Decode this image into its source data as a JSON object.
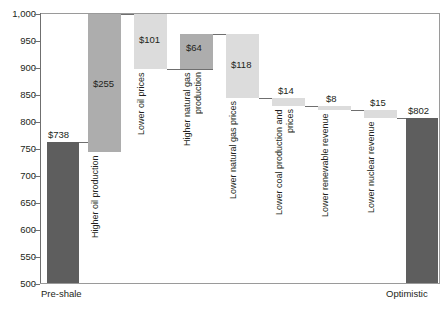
{
  "chart_data": {
    "type": "bar",
    "subtype": "waterfall",
    "title": "",
    "subtitle": "",
    "xlabel": "",
    "ylabel": "",
    "ylim": [
      500,
      1000
    ],
    "ytick_labels": [
      "1,000",
      "950",
      "900",
      "850",
      "800",
      "750",
      "700",
      "650",
      "600",
      "550",
      "500"
    ],
    "ytick_values": [
      1000,
      950,
      900,
      850,
      800,
      750,
      700,
      650,
      600,
      550,
      500
    ],
    "grid": false,
    "legend": "none",
    "categories": [
      "Pre-shale",
      "Higher oil production",
      "Lower oil prices",
      "Higher natural gas production",
      "Lower natural gas prices",
      "Lower coal production and prices",
      "Lower renewable revenue",
      "Lower nuclear revenue",
      "Optimistic"
    ],
    "x_axis_labels": [
      "Pre-shale",
      "Optimistic"
    ],
    "deltas": [
      738,
      255,
      -101,
      64,
      -118,
      -14,
      -8,
      -15,
      802
    ],
    "data_labels": [
      "$738",
      "$255",
      "$101",
      "$64",
      "$118",
      "$14",
      "$8",
      "$15",
      "$802"
    ],
    "cumulative": [
      738,
      993,
      892,
      956,
      838,
      824,
      816,
      801,
      802
    ],
    "bar_kinds": [
      "total",
      "increase",
      "decrease",
      "increase",
      "decrease",
      "decrease",
      "decrease",
      "decrease",
      "total"
    ],
    "colors": {
      "total": "#5e5e5e",
      "increase": "#adadad",
      "decrease": "#dcdcdc",
      "axis": "#6f6f6f",
      "frame": "#9a9a9a",
      "text": "#231f20"
    }
  },
  "bars": [
    {
      "name": "Pre-shale",
      "value_label": "$738",
      "rot_label": "",
      "x_label": "Pre-shale",
      "kind": "total",
      "cls": "dark",
      "left": 47,
      "width": 32,
      "top": 142,
      "height": 141,
      "vlabel_left": 48,
      "vlabel_top": 129,
      "rlabel_left": 0,
      "rlabel_top": 0,
      "rlabel_height": 0,
      "connector_left": 0,
      "connector_top": 0,
      "connector_width": 0
    },
    {
      "name": "Higher oil production",
      "value_label": "$255",
      "rot_label": "Higher oil production",
      "x_label": "",
      "kind": "increase",
      "cls": "mid",
      "left": 88,
      "width": 33,
      "top": 14,
      "height": 138,
      "vlabel_left": 93,
      "vlabel_top": 78,
      "rlabel_left": 90,
      "rlabel_top": 155,
      "rlabel_height": 100,
      "connector_left": 79,
      "connector_top": 142,
      "connector_width": 42
    },
    {
      "name": "Lower oil prices",
      "value_label": "$101",
      "rot_label": "Lower oil prices",
      "x_label": "",
      "kind": "decrease",
      "cls": "light",
      "left": 134,
      "width": 33,
      "top": 14,
      "height": 55,
      "vlabel_left": 139,
      "vlabel_top": 34,
      "rlabel_left": 136,
      "rlabel_top": 72,
      "rlabel_height": 90,
      "connector_left": 121,
      "connector_top": 14,
      "connector_width": 46
    },
    {
      "name": "Higher natural gas production",
      "value_label": "$64",
      "rot_label": "Higher natural gas production",
      "x_label": "",
      "kind": "increase",
      "cls": "mid",
      "left": 180,
      "width": 33,
      "top": 34,
      "height": 35,
      "vlabel_left": 186,
      "vlabel_top": 42,
      "rlabel_left": 182,
      "rlabel_top": 72,
      "rlabel_height": 110,
      "connector_left": 167,
      "connector_top": 69,
      "connector_width": 46
    },
    {
      "name": "Lower natural gas prices",
      "value_label": "$118",
      "rot_label": "Lower natural gas prices",
      "x_label": "",
      "kind": "decrease",
      "cls": "light",
      "left": 226,
      "width": 33,
      "top": 34,
      "height": 64,
      "vlabel_left": 231,
      "vlabel_top": 59,
      "rlabel_left": 228,
      "rlabel_top": 101,
      "rlabel_height": 110,
      "connector_left": 213,
      "connector_top": 34,
      "connector_width": 46
    },
    {
      "name": "Lower coal production and prices",
      "value_label": "$14",
      "rot_label": "Lower coal production and prices",
      "x_label": "",
      "kind": "decrease",
      "cls": "light",
      "left": 272,
      "width": 33,
      "top": 98,
      "height": 8,
      "vlabel_left": 278,
      "vlabel_top": 85,
      "rlabel_left": 274,
      "rlabel_top": 109,
      "rlabel_height": 120,
      "connector_left": 259,
      "connector_top": 98,
      "connector_width": 46
    },
    {
      "name": "Lower renewable revenue",
      "value_label": "$8",
      "rot_label": "Lower renewable revenue",
      "x_label": "",
      "kind": "decrease",
      "cls": "light",
      "left": 318,
      "width": 33,
      "top": 106,
      "height": 4,
      "vlabel_left": 326,
      "vlabel_top": 93,
      "rlabel_left": 320,
      "rlabel_top": 113,
      "rlabel_height": 110,
      "connector_left": 305,
      "connector_top": 106,
      "connector_width": 46
    },
    {
      "name": "Lower nuclear revenue",
      "value_label": "$15",
      "rot_label": "Lower nuclear revenue",
      "x_label": "",
      "kind": "decrease",
      "cls": "light",
      "left": 364,
      "width": 33,
      "top": 110,
      "height": 8,
      "vlabel_left": 370,
      "vlabel_top": 97,
      "rlabel_left": 366,
      "rlabel_top": 121,
      "rlabel_height": 105,
      "connector_left": 351,
      "connector_top": 110,
      "connector_width": 46
    },
    {
      "name": "Optimistic",
      "value_label": "$802",
      "rot_label": "",
      "x_label": "Optimistic",
      "kind": "total",
      "cls": "dark",
      "left": 406,
      "width": 32,
      "top": 118,
      "height": 165,
      "vlabel_left": 408,
      "vlabel_top": 105,
      "rlabel_left": 0,
      "rlabel_top": 0,
      "rlabel_height": 0,
      "connector_left": 397,
      "connector_top": 118,
      "connector_width": 41
    }
  ],
  "yticks": [
    {
      "label": "1,000",
      "top": 9
    },
    {
      "label": "950",
      "top": 36
    },
    {
      "label": "900",
      "top": 63
    },
    {
      "label": "850",
      "top": 90
    },
    {
      "label": "800",
      "top": 117
    },
    {
      "label": "750",
      "top": 144
    },
    {
      "label": "700",
      "top": 171
    },
    {
      "label": "650",
      "top": 198
    },
    {
      "label": "600",
      "top": 225
    },
    {
      "label": "550",
      "top": 252
    },
    {
      "label": "500",
      "top": 279
    }
  ],
  "xlabels": [
    {
      "label": "Pre-shale",
      "left": 41
    },
    {
      "label": "Optimistic",
      "left": 386
    }
  ]
}
